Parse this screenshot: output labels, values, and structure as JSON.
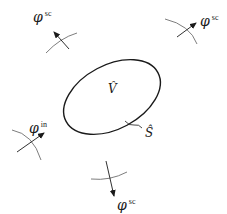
{
  "diagram": {
    "volume_label": "V̂",
    "surface_label": "Ŝ",
    "waves": [
      {
        "id": "scattered-top-left",
        "symbol": "φ",
        "superscript": "sc"
      },
      {
        "id": "scattered-top-right",
        "symbol": "φ",
        "superscript": "sc"
      },
      {
        "id": "incident-left",
        "symbol": "φ",
        "superscript": "in"
      },
      {
        "id": "scattered-bottom",
        "symbol": "φ",
        "superscript": "sc"
      }
    ],
    "colors": {
      "stroke": "#1a1a1a",
      "wavefront": "#6e6e6e",
      "background": "#ffffff"
    }
  }
}
